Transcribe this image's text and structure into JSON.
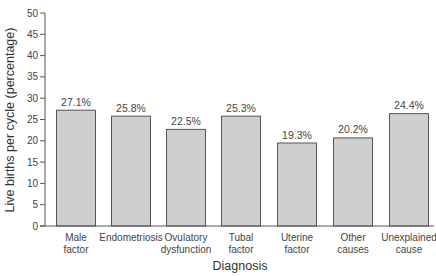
{
  "chart_data": {
    "type": "bar",
    "title": "",
    "xlabel": "Diagnosis",
    "ylabel": "Live births per cycle (percentage)",
    "ylim": [
      0,
      50
    ],
    "yticks": [
      0,
      5,
      10,
      15,
      20,
      25,
      30,
      35,
      40,
      45,
      50
    ],
    "grid": false,
    "legend": null,
    "categories": [
      [
        "Male",
        "factor"
      ],
      [
        "Endometriosis"
      ],
      [
        "Ovulatory",
        "dysfunction"
      ],
      [
        "Tubal",
        "factor"
      ],
      [
        "Uterine",
        "factor"
      ],
      [
        "Other",
        "causes"
      ],
      [
        "Unexplained",
        "cause"
      ]
    ],
    "category_names": [
      "Male factor",
      "Endometriosis",
      "Ovulatory dysfunction",
      "Tubal factor",
      "Uterine factor",
      "Other causes",
      "Unexplained cause"
    ],
    "values": [
      27.1,
      25.8,
      22.5,
      25.3,
      19.3,
      20.2,
      24.4
    ],
    "value_labels": [
      "27.1%",
      "25.8%",
      "22.5%",
      "25.3%",
      "19.3%",
      "20.2%",
      "24.4%"
    ],
    "drawn_heights": [
      27.3,
      25.9,
      22.8,
      25.9,
      19.6,
      20.8,
      26.5
    ],
    "colors": {
      "bar_fill": "#cfcfcf",
      "bar_stroke": "#555555",
      "axis": "#555555"
    }
  }
}
